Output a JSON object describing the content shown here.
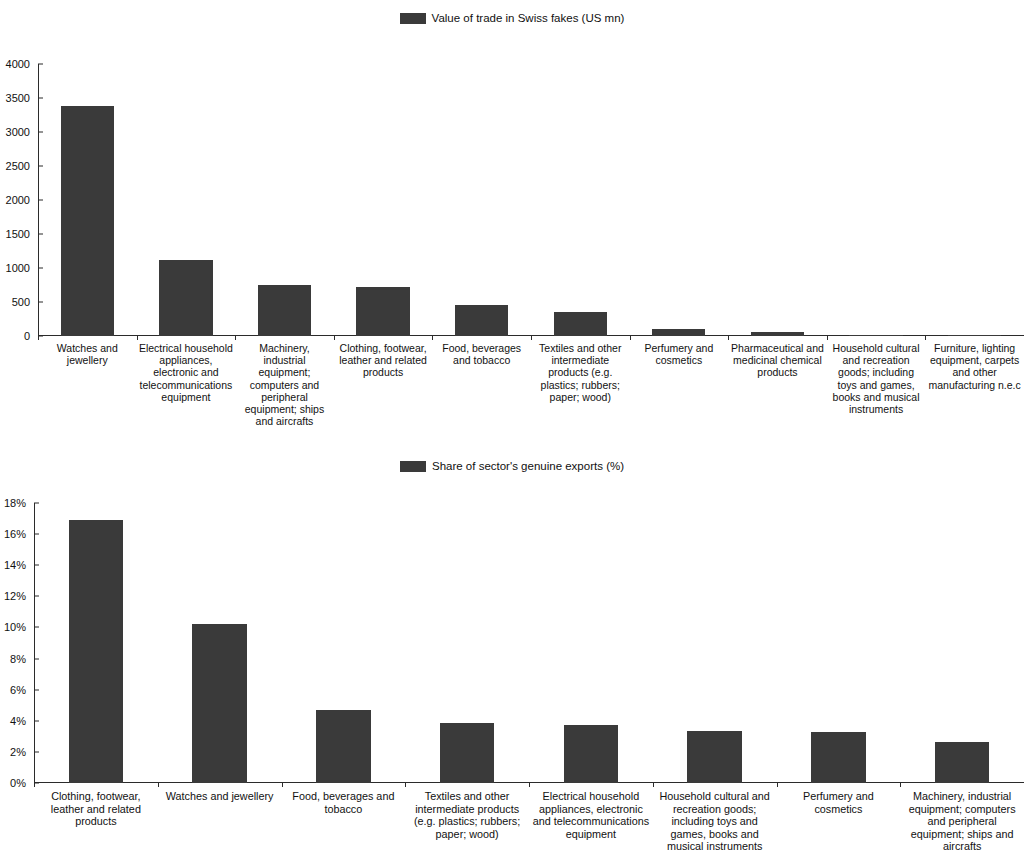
{
  "chart_data": [
    {
      "type": "bar",
      "title": "Value of trade in Swiss fakes (US mn)",
      "legend_label": "Value of trade in Swiss fakes (US mn)",
      "legend_position": "top-center",
      "xlabel": "",
      "ylabel": "",
      "ylim": [
        0,
        4000
      ],
      "yticks": [
        "0",
        "500",
        "1000",
        "1500",
        "2000",
        "2500",
        "3000",
        "3500",
        "4000"
      ],
      "ytick_values": [
        0,
        500,
        1000,
        1500,
        2000,
        2500,
        3000,
        3500,
        4000
      ],
      "grid": false,
      "bar_color": "#3a3a3a",
      "categories": [
        "Watches and jewellery",
        "Electrical household appliances, electronic and telecommunications equipment",
        "Machinery, industrial equipment; computers and peripheral equipment; ships and aircrafts",
        "Clothing, footwear, leather and related products",
        "Food, beverages and tobacco",
        "Textiles and other intermediate products (e.g. plastics; rubbers; paper; wood)",
        "Perfumery and cosmetics",
        "Pharmaceutical and medicinal chemical products",
        "Household cultural and recreation goods;  including toys and games, books and musical instruments",
        "Furniture, lighting equipment, carpets and other manufacturing n.e.c"
      ],
      "values": [
        3380,
        1125,
        745,
        715,
        450,
        355,
        110,
        55,
        8,
        4
      ]
    },
    {
      "type": "bar",
      "title": "Share of sector's genuine exports (%)",
      "legend_label": "Share of sector's genuine exports (%)",
      "legend_position": "top-center",
      "xlabel": "",
      "ylabel": "",
      "ylim": [
        0,
        18
      ],
      "yticks": [
        "0%",
        "2%",
        "4%",
        "6%",
        "8%",
        "10%",
        "12%",
        "14%",
        "16%",
        "18%"
      ],
      "ytick_values": [
        0,
        2,
        4,
        6,
        8,
        10,
        12,
        14,
        16,
        18
      ],
      "grid": false,
      "bar_color": "#3a3a3a",
      "categories": [
        "Clothing, footwear, leather and related products",
        "Watches and jewellery",
        "Food, beverages and tobacco",
        "Textiles and other intermediate products (e.g. plastics; rubbers; paper; wood)",
        "Electrical household appliances, electronic and telecommunications equipment",
        "Household cultural and recreation goods;  including toys and games, books and musical instruments",
        "Perfumery and cosmetics",
        "Machinery, industrial equipment; computers and peripheral equipment; ships and aircrafts"
      ],
      "values": [
        16.9,
        10.2,
        4.7,
        3.85,
        3.7,
        3.35,
        3.3,
        2.65
      ]
    }
  ]
}
